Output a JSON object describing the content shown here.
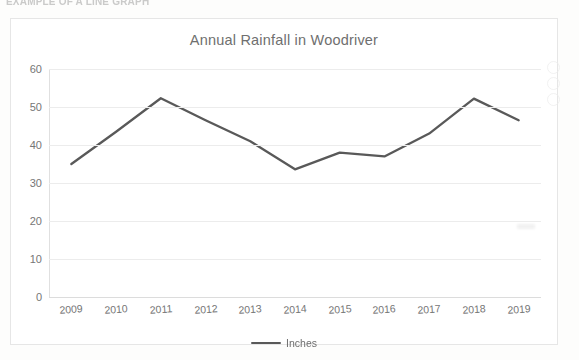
{
  "page": {
    "scan_header_text": "EXAMPLE OF A LINE GRAPH"
  },
  "chart": {
    "title": "Annual Rainfall in Woodriver",
    "legend_label": "Inches",
    "legend_swatch_name": "line-swatch",
    "series_color": "#595959",
    "gridline_color": "#ececec",
    "axis_text_color": "#767676",
    "title_color": "#6f6f6f",
    "border_color": "#e6e6e6",
    "plot_background": "#ffffff"
  },
  "chart_data": {
    "type": "line",
    "title": "Annual Rainfall in Woodriver",
    "xlabel": "",
    "ylabel": "",
    "categories": [
      "2009",
      "2010",
      "2011",
      "2012",
      "2013",
      "2014",
      "2015",
      "2016",
      "2017",
      "2018",
      "2019"
    ],
    "series": [
      {
        "name": "Inches",
        "color": "#595959",
        "values": [
          35,
          43.5,
          52.3,
          46.5,
          41,
          33.6,
          38,
          37,
          43,
          52.2,
          46.5
        ]
      }
    ],
    "ylim": [
      0,
      60
    ],
    "yticks": [
      0,
      10,
      20,
      30,
      40,
      50,
      60
    ],
    "ytick_labels": [
      "0",
      "10",
      "20",
      "30",
      "40",
      "50",
      "60"
    ],
    "grid": true,
    "grid_axis": "y",
    "legend": true,
    "legend_position": "bottom",
    "markers": false
  }
}
